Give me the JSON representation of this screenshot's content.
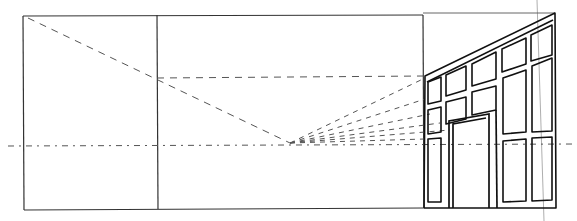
{
  "diagram": {
    "type": "one-point perspective sketch",
    "colors": {
      "line": "#333333",
      "ink": "#111111",
      "guide": "#555555",
      "background": "#ffffff"
    },
    "frame": {
      "x1": 23,
      "y1": 15,
      "x2": 530,
      "y2": 210
    },
    "dividers": [
      157,
      423
    ],
    "horizon_y": 146,
    "vanishing_point": {
      "x": 290,
      "y": 143
    },
    "facade": {
      "left_x": 423,
      "right_x": 555,
      "top_left_y": 76,
      "top_right_y": 13,
      "bottom_y": 208
    },
    "elements": [
      "outer-frame",
      "panel-divider-left",
      "panel-divider-right",
      "horizon-line",
      "diagonal-guide",
      "horizontal-guide",
      "convergence-lines",
      "window-grid-facade",
      "doorway",
      "vertical-guide-right"
    ]
  }
}
